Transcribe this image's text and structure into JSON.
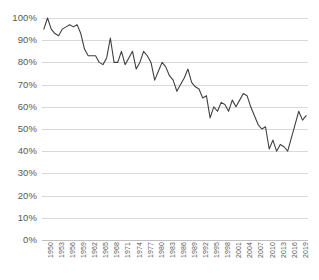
{
  "chart_data": {
    "type": "line",
    "title": "",
    "subtitle": "",
    "xlabel": "",
    "ylabel": "",
    "ylim": [
      0,
      100
    ],
    "xlim": [
      1950,
      2021
    ],
    "grid": true,
    "legend": false,
    "legend_position": "none",
    "y_tick_labels": [
      "100%",
      "90%",
      "80%",
      "70%",
      "60%",
      "50%",
      "40%",
      "30%",
      "20%",
      "10%",
      "0%"
    ],
    "y_tick_values": [
      100,
      90,
      80,
      70,
      60,
      50,
      40,
      30,
      20,
      10,
      0
    ],
    "x_tick_labels": [
      "1950",
      "1953",
      "1956",
      "1959",
      "1962",
      "1965",
      "1968",
      "1971",
      "1974",
      "1977",
      "1980",
      "1983",
      "1986",
      "1989",
      "1992",
      "1995",
      "1998",
      "2001",
      "2004",
      "2007",
      "2010",
      "2013",
      "2016",
      "2019"
    ],
    "x_tick_step": 3,
    "line_color": "#404040",
    "grid_color": "#d9d9d9",
    "axis_color": "#bfbfbf",
    "text_color": "#595959",
    "series": [
      {
        "name": "",
        "x": [
          1950,
          1951,
          1952,
          1953,
          1954,
          1955,
          1956,
          1957,
          1958,
          1959,
          1960,
          1961,
          1962,
          1963,
          1964,
          1965,
          1966,
          1967,
          1968,
          1969,
          1970,
          1971,
          1972,
          1973,
          1974,
          1975,
          1976,
          1977,
          1978,
          1979,
          1980,
          1981,
          1982,
          1983,
          1984,
          1985,
          1986,
          1987,
          1988,
          1989,
          1990,
          1991,
          1992,
          1993,
          1994,
          1995,
          1996,
          1997,
          1998,
          1999,
          2000,
          2001,
          2002,
          2003,
          2004,
          2005,
          2006,
          2007,
          2008,
          2009,
          2010,
          2011,
          2012,
          2013,
          2014,
          2015,
          2016,
          2017,
          2018,
          2019,
          2020,
          2021
        ],
        "values": [
          95,
          100,
          95,
          93,
          92,
          95,
          96,
          97,
          96,
          97,
          93,
          86,
          83,
          83,
          83,
          80,
          79,
          82,
          91,
          80,
          80,
          85,
          79,
          82,
          85,
          77,
          80,
          85,
          83,
          80,
          72,
          76,
          80,
          78,
          74,
          72,
          67,
          70,
          73,
          77,
          71,
          69,
          68,
          64,
          65,
          55,
          60,
          58,
          62,
          61,
          58,
          63,
          60,
          63,
          66,
          65,
          60,
          56,
          52,
          50,
          51,
          41,
          45,
          40,
          43,
          42,
          40,
          46,
          52,
          58,
          54,
          56
        ]
      }
    ]
  }
}
